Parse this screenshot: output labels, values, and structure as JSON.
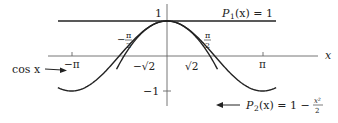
{
  "figure": {
    "axes": {
      "x_label": "x",
      "y_tick_top": "1",
      "y_tick_bottom": "−1",
      "x_ticks": [
        {
          "id": "neg_pi",
          "label": "−π",
          "value": -3.14159
        },
        {
          "id": "pi",
          "label": "π",
          "value": 3.14159
        }
      ],
      "annotations": {
        "neg_half_pi": {
          "minus": "−",
          "num": "π",
          "den": "2",
          "value": -1.5708
        },
        "half_pi": {
          "num": "π",
          "den": "2",
          "value": 1.5708
        },
        "neg_sqrt2": {
          "text": "−√2",
          "value": -1.41421
        },
        "sqrt2": {
          "text": "√2",
          "value": 1.41421
        }
      }
    },
    "curves": [
      {
        "id": "cos",
        "label": "cos x",
        "formula": "cos(x)"
      },
      {
        "id": "p1",
        "label": "P₁(x) = 1",
        "formula": "1"
      },
      {
        "id": "p2",
        "label": "P₂(x) = 1 − x²/2",
        "formula": "1 - x^2/2"
      }
    ],
    "labels": {
      "cos": "cos x",
      "p1_lhs": "P",
      "p1_sub": "1",
      "p1_rest": "(x) = 1",
      "p2_lhs": "P",
      "p2_sub": "2",
      "p2_rest": "(x) = 1 −",
      "p2_frac_num": "x²",
      "p2_frac_den": "2"
    },
    "colors": {
      "curve": "#222222",
      "axis": "#555555",
      "background": "#ffffff"
    }
  }
}
